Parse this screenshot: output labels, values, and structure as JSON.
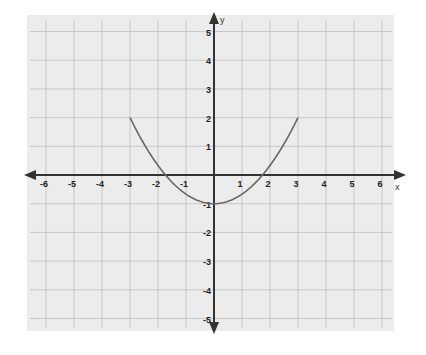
{
  "chart_data": {
    "type": "line",
    "title": "",
    "xlabel": "x",
    "ylabel": "y",
    "xlim": [
      -6,
      6
    ],
    "ylim": [
      -5,
      5
    ],
    "grid": true,
    "x_ticks": [
      "-6",
      "-5",
      "-4",
      "-3",
      "-2",
      "-1",
      "1",
      "2",
      "3",
      "4",
      "5",
      "6"
    ],
    "y_ticks": [
      "5",
      "4",
      "3",
      "2",
      "1",
      "-1",
      "-2",
      "-3",
      "-4",
      "-5"
    ],
    "series": [
      {
        "name": "parabola",
        "equation": "y = x^2/3 - 1",
        "domain": [
          -3,
          3
        ],
        "x": [
          -3,
          -2.5,
          -2,
          -1.5,
          -1,
          -0.5,
          0,
          0.5,
          1,
          1.5,
          2,
          2.5,
          3
        ],
        "values": [
          2,
          1.08,
          0.33,
          -0.25,
          -0.67,
          -0.92,
          -1,
          -0.92,
          -0.67,
          -0.25,
          0.33,
          1.08,
          2
        ],
        "color": "#666666"
      }
    ],
    "colors": {
      "background": "#ececec",
      "grid": "#c8c8c8",
      "axis": "#333333",
      "curve": "#666666"
    }
  }
}
